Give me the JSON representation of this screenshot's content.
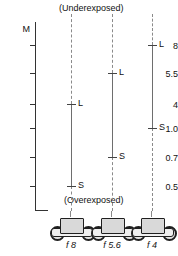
{
  "figure": {
    "title_top": "(Underexposed)",
    "title_bottom": "(Overexposed)",
    "axis_title": "M"
  },
  "axis": {
    "ticks": [
      {
        "label": "8",
        "y": 45
      },
      {
        "label": "5.5",
        "y": 73
      },
      {
        "label": "4",
        "y": 104
      },
      {
        "label": "1.0",
        "y": 128
      },
      {
        "label": "0.7",
        "y": 157
      },
      {
        "label": "0.5",
        "y": 186
      }
    ]
  },
  "columns": [
    {
      "aperture": "f 8",
      "x": 71,
      "upper_label": "L",
      "lower_label": "S",
      "upper_y": 104,
      "lower_y": 186
    },
    {
      "aperture": "f 5.6",
      "x": 112,
      "upper_label": "L",
      "lower_label": "S",
      "upper_y": 73,
      "lower_y": 157
    },
    {
      "aperture": "f 4",
      "x": 152,
      "upper_label": "L",
      "lower_label": "S",
      "upper_y": 45,
      "lower_y": 128
    }
  ],
  "chart_data": {
    "type": "bar",
    "title": "",
    "subtitle": "",
    "xlabel": "",
    "ylabel": "M",
    "grid": false,
    "legend": false,
    "annotations": [
      "(Underexposed)",
      "(Overexposed)"
    ],
    "categories": [
      "f 8",
      "f 5.6",
      "f 4"
    ],
    "ytick_labels": [
      "8",
      "5.5",
      "4",
      "1.0",
      "0.7",
      "0.5"
    ],
    "ytick_values": [
      8,
      5.5,
      4,
      1.0,
      0.7,
      0.5
    ],
    "series": [
      {
        "name": "L",
        "values": [
          4,
          5.5,
          8
        ]
      },
      {
        "name": "S",
        "values": [
          0.5,
          0.7,
          1.0
        ]
      }
    ],
    "ranges": [
      {
        "category": "f 8",
        "S": 0.5,
        "L": 4
      },
      {
        "category": "f 5.6",
        "S": 0.7,
        "L": 5.5
      },
      {
        "category": "f 4",
        "S": 1.0,
        "L": 8
      }
    ]
  }
}
